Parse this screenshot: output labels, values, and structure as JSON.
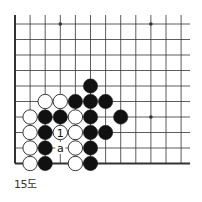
{
  "diagram": {
    "caption": "15도",
    "grid": {
      "x0": 15,
      "dx": 15.1,
      "cols": 12,
      "y0": 24,
      "dy": 15.5,
      "rows": 10,
      "right_extent": 190,
      "top_extent": 15,
      "edges": [
        "left",
        "bottom"
      ]
    },
    "star_points": [
      [
        3,
        0
      ],
      [
        9,
        0
      ],
      [
        9,
        6
      ]
    ],
    "stones": [
      {
        "col": 5,
        "row": 4,
        "color": "black"
      },
      {
        "col": 2,
        "row": 5,
        "color": "white"
      },
      {
        "col": 3,
        "row": 5,
        "color": "white"
      },
      {
        "col": 4,
        "row": 5,
        "color": "black"
      },
      {
        "col": 5,
        "row": 5,
        "color": "black"
      },
      {
        "col": 6,
        "row": 5,
        "color": "black"
      },
      {
        "col": 1,
        "row": 6,
        "color": "white"
      },
      {
        "col": 2,
        "row": 6,
        "color": "black"
      },
      {
        "col": 3,
        "row": 6,
        "color": "black"
      },
      {
        "col": 4,
        "row": 6,
        "color": "white"
      },
      {
        "col": 5,
        "row": 6,
        "color": "black"
      },
      {
        "col": 7,
        "row": 6,
        "color": "black"
      },
      {
        "col": 1,
        "row": 7,
        "color": "white"
      },
      {
        "col": 2,
        "row": 7,
        "color": "black"
      },
      {
        "col": 3,
        "row": 7,
        "color": "white",
        "label": "1"
      },
      {
        "col": 4,
        "row": 7,
        "color": "white"
      },
      {
        "col": 5,
        "row": 7,
        "color": "black"
      },
      {
        "col": 6,
        "row": 7,
        "color": "black"
      },
      {
        "col": 1,
        "row": 8,
        "color": "white"
      },
      {
        "col": 2,
        "row": 8,
        "color": "black"
      },
      {
        "col": 4,
        "row": 8,
        "color": "white"
      },
      {
        "col": 5,
        "row": 8,
        "color": "black"
      },
      {
        "col": 1,
        "row": 9,
        "color": "white"
      },
      {
        "col": 2,
        "row": 9,
        "color": "black"
      },
      {
        "col": 4,
        "row": 9,
        "color": "white"
      },
      {
        "col": 5,
        "row": 9,
        "color": "black"
      }
    ],
    "point_labels": [
      {
        "col": 3,
        "row": 8,
        "text": "a"
      }
    ],
    "colors": {
      "line": "#333333",
      "black_stone": "#111111",
      "white_stone": "#ffffff",
      "stone_outline": "#222222"
    }
  }
}
